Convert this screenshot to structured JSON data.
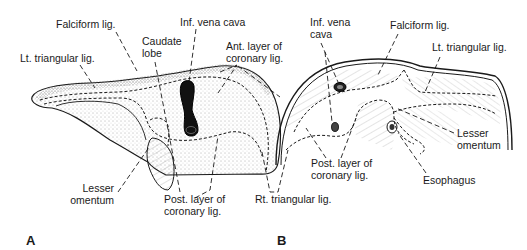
{
  "figure": {
    "panels": [
      {
        "id": "A",
        "label": "A",
        "view": "liver-superior-posterior",
        "labels": {
          "falciform": "Falciform lig.",
          "ivc": "Inf. vena cava",
          "caudate": [
            "Caudate",
            "lobe"
          ],
          "ant_coronary": [
            "Ant. layer of",
            "coronary lig."
          ],
          "lt_triangular": "Lt. triangular lig.",
          "lesser_omentum": [
            "Lesser",
            "omentum"
          ],
          "post_coronary": [
            "Post. layer of",
            "coronary lig."
          ]
        }
      },
      {
        "id": "B",
        "label": "B",
        "view": "diaphragm-inferior",
        "labels": {
          "ivc": [
            "Inf. vena",
            "cava"
          ],
          "falciform": "Falciform lig.",
          "lt_triangular": "Lt. triangular lig.",
          "lesser_omentum": [
            "Lesser",
            "omentum"
          ],
          "post_coronary": [
            "Post. layer of",
            "coronary lig."
          ],
          "esophagus": "Esophagus"
        }
      }
    ],
    "shared_labels": {
      "rt_triangular": "Rt. triangular lig."
    }
  },
  "colors": {
    "ink": "#1a1a1a",
    "background": "#ffffff",
    "stipple": "#555555"
  }
}
